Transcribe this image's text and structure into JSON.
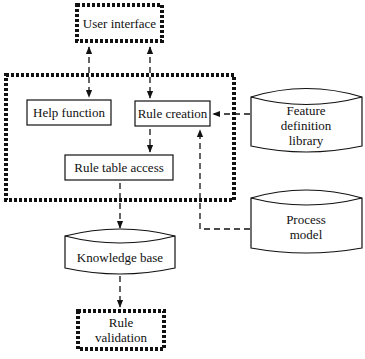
{
  "diagram": {
    "nodes": {
      "user_interface": {
        "label": "User interface",
        "style": "dotted-box"
      },
      "help_function": {
        "label": "Help function",
        "style": "solid-box"
      },
      "rule_creation": {
        "label": "Rule creation",
        "style": "solid-box"
      },
      "rule_table_access": {
        "label": "Rule table access",
        "style": "solid-box"
      },
      "feature_library": {
        "label_lines": [
          "Feature",
          "definition",
          "library"
        ],
        "style": "cylinder"
      },
      "process_model": {
        "label_lines": [
          "Process",
          "model"
        ],
        "style": "cylinder"
      },
      "knowledge_base": {
        "label": "Knowledge base",
        "style": "cylinder"
      },
      "rule_validation": {
        "label_lines": [
          "Rule",
          "validation"
        ],
        "style": "dotted-box"
      }
    },
    "containers": {
      "rule_editor_group": {
        "contains": [
          "help_function",
          "rule_creation",
          "rule_table_access"
        ],
        "style": "dotted-box"
      }
    },
    "edges": [
      {
        "from": "user_interface",
        "to": "help_function",
        "style": "dashed",
        "direction": "both"
      },
      {
        "from": "user_interface",
        "to": "rule_creation",
        "style": "dashed",
        "direction": "both"
      },
      {
        "from": "feature_library",
        "to": "rule_creation",
        "style": "dashed",
        "direction": "forward"
      },
      {
        "from": "rule_creation",
        "to": "rule_table_access",
        "style": "dashed",
        "direction": "forward"
      },
      {
        "from": "process_model",
        "to": "rule_creation",
        "style": "dashed",
        "direction": "forward"
      },
      {
        "from": "rule_table_access",
        "to": "knowledge_base",
        "style": "dashed",
        "direction": "forward"
      },
      {
        "from": "knowledge_base",
        "to": "rule_validation",
        "style": "dashed",
        "direction": "forward"
      }
    ]
  }
}
